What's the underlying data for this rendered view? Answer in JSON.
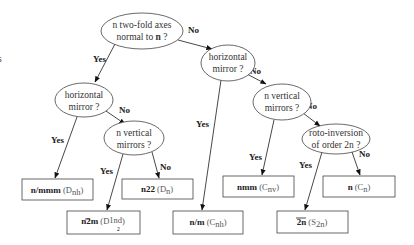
{
  "diagram": {
    "type": "decision-tree",
    "nodes": {
      "root": {
        "line1": "n two-fold axes",
        "line2": "normal to ",
        "line2_bold": "n",
        "line2_end": " ?"
      },
      "hm_left": {
        "line1": "horizontal",
        "line2": "mirror ?"
      },
      "vm_left": {
        "line1": "n vertical",
        "line2": "mirrors ?"
      },
      "hm_right": {
        "line1": "horizontal",
        "line2": "mirror ?"
      },
      "vm_right": {
        "line1": "n vertical",
        "line2": "mirrors ?"
      },
      "roto": {
        "line1": "roto-inversion",
        "line2": "of order 2n ?"
      }
    },
    "results": {
      "nmmm": {
        "symbol": "n/mmm",
        "group": "D",
        "sub": "nh"
      },
      "n22": {
        "symbol": "n22",
        "group": "D",
        "sub": "n"
      },
      "nbar2m": {
        "symbol": "n2m",
        "group": "D",
        "sub_top": "1",
        "sub_bottom": "2",
        "sub": "nd"
      },
      "nm": {
        "symbol": "n/m",
        "group": "C",
        "sub": "nh"
      },
      "nmm": {
        "symbol": "nmm",
        "group": "C",
        "sub": "nv"
      },
      "n": {
        "symbol": "n",
        "group": "C",
        "sub": "n"
      },
      "bar2n": {
        "symbol": "2n",
        "group": "S",
        "sub": "2n"
      }
    },
    "edge_labels": {
      "yes": "Yes",
      "no": "No"
    },
    "edge_color": "#333333",
    "stroke_color": "#444444"
  }
}
